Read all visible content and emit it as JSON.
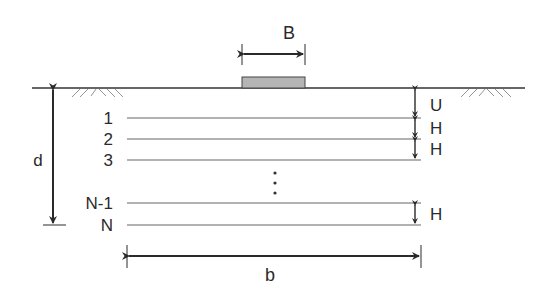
{
  "diagram": {
    "type": "soil-layer-discretization",
    "footing": {
      "label": "B",
      "fill": "#b5b5b5"
    },
    "depth": {
      "label": "d"
    },
    "width": {
      "label": "b"
    },
    "layers": [
      {
        "label": "1"
      },
      {
        "label": "2"
      },
      {
        "label": "3"
      },
      {
        "label": "N-1"
      },
      {
        "label": "N"
      }
    ],
    "spacings": [
      {
        "label": "U"
      },
      {
        "label": "H"
      },
      {
        "label": "H"
      },
      {
        "label": "H"
      }
    ],
    "ellipsis": "⋮",
    "colors": {
      "line": "#333333",
      "layer_line": "#666666",
      "hatch": "#888888"
    }
  }
}
